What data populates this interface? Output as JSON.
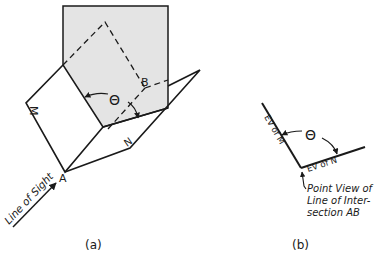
{
  "figure_a": {
    "caption": "(a)",
    "plane_m_label": "M",
    "plane_n_label": "N",
    "point_a_label": "A",
    "point_b_label": "B",
    "angle_label": "Θ",
    "line_of_sight_label": "Line of Sight",
    "colors": {
      "shade": "#e4e4e4",
      "stroke": "#1a1a1a"
    }
  },
  "figure_b": {
    "caption": "(b)",
    "ev_m_label": "EV of M",
    "ev_n_label": "EV of N",
    "angle_label": "Θ",
    "point_view_lines": [
      "Point View of",
      "Line of Inter-",
      "section AB"
    ]
  }
}
